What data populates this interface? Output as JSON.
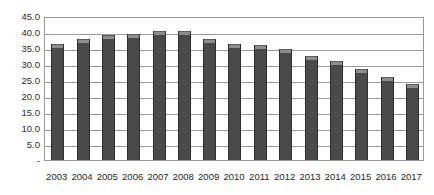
{
  "chart_data": {
    "type": "bar",
    "title": "",
    "subtitle": "",
    "xlabel": "",
    "ylabel": "",
    "categories": [
      "2003",
      "2004",
      "2005",
      "2006",
      "2007",
      "2008",
      "2009",
      "2010",
      "2011",
      "2012",
      "2013",
      "2014",
      "2015",
      "2016",
      "2017"
    ],
    "values": [
      36.2,
      37.8,
      39.0,
      39.4,
      40.2,
      40.3,
      37.8,
      36.2,
      35.9,
      34.7,
      32.5,
      30.9,
      28.4,
      25.9,
      23.8
    ],
    "series": [
      {
        "name": "",
        "values": [
          36.2,
          37.8,
          39.0,
          39.4,
          40.2,
          40.3,
          37.8,
          36.2,
          35.9,
          34.7,
          32.5,
          30.9,
          28.4,
          25.9,
          23.8
        ]
      }
    ],
    "ylim": [
      0,
      45
    ],
    "ytick_values": [
      45.0,
      40.0,
      35.0,
      30.0,
      25.0,
      20.0,
      15.0,
      10.0,
      5.0,
      0
    ],
    "ytick_labels": [
      "45.0",
      "40.0",
      "35.0",
      "30.0",
      "25.0",
      "20.0",
      "15.0",
      "10.0",
      "5.0",
      "-"
    ],
    "grid": true,
    "grid_axis": "y",
    "legend": false,
    "legend_position": "none",
    "bar_color": "#4a4a4a",
    "bar_cap_color": "#8d8d8d",
    "gridline_color": "#9a9a9a",
    "plot_border_color": "#9a9a9a",
    "background_color": "#ffffff",
    "annotations": []
  }
}
